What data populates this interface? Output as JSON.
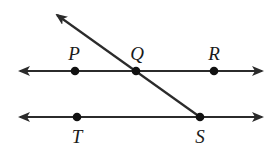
{
  "diagram": {
    "colors": {
      "stroke": "#2b2b2b",
      "point": "#111111",
      "text": "#1a1a1a"
    },
    "lines": [
      {
        "name": "line-PR",
        "x1": 20,
        "y1": 71,
        "x2": 262,
        "y2": 71,
        "arrows": "both"
      },
      {
        "name": "line-TS",
        "x1": 20,
        "y1": 117,
        "x2": 262,
        "y2": 117,
        "arrows": "both"
      },
      {
        "name": "transversal",
        "x1": 57,
        "y1": 15,
        "x2": 200,
        "y2": 117,
        "arrows": "start"
      }
    ],
    "points": [
      {
        "label": "P",
        "x": 75,
        "y": 71,
        "lx": 74,
        "ly": 53
      },
      {
        "label": "Q",
        "x": 136,
        "y": 71,
        "lx": 137,
        "ly": 53
      },
      {
        "label": "R",
        "x": 214,
        "y": 71,
        "lx": 214,
        "ly": 53
      },
      {
        "label": "T",
        "x": 77,
        "y": 117,
        "lx": 77,
        "ly": 136
      },
      {
        "label": "S",
        "x": 200,
        "y": 117,
        "lx": 200,
        "ly": 136
      }
    ]
  }
}
